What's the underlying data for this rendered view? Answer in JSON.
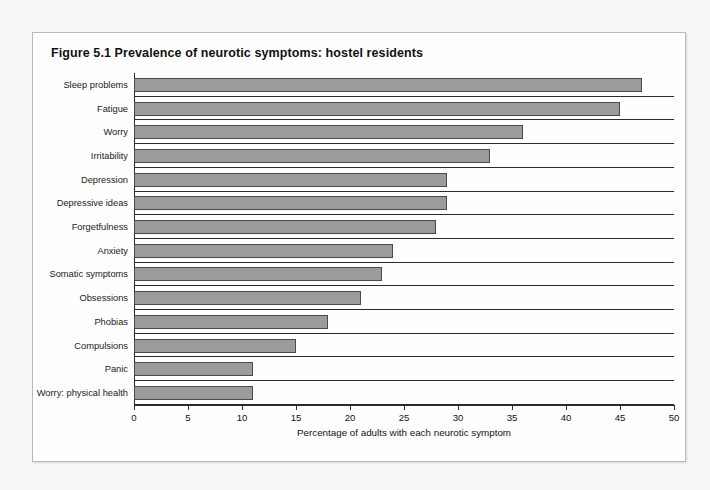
{
  "figure": {
    "title": "Figure 5.1  Prevalence of neurotic symptoms: hostel residents"
  },
  "chart_data": {
    "type": "bar",
    "orientation": "horizontal",
    "title": "Figure 5.1  Prevalence of neurotic symptoms: hostel residents",
    "xlabel": "Percentage of adults with each neurotic symptom",
    "ylabel": "",
    "xlim": [
      0,
      50
    ],
    "xticks": [
      0,
      5,
      10,
      15,
      20,
      25,
      30,
      35,
      40,
      45,
      50
    ],
    "xtick_labels": [
      "0",
      "5",
      "10",
      "15",
      "20",
      "25",
      "30",
      "35",
      "40",
      "45",
      "50"
    ],
    "grid": false,
    "legend": false,
    "bar_color": "#9b9b9b",
    "bar_edge_color": "#4a4a4a",
    "categories": [
      "Sleep problems",
      "Fatigue",
      "Worry",
      "Irritability",
      "Depression",
      "Depressive ideas",
      "Forgetfulness",
      "Anxiety",
      "Somatic symptoms",
      "Obsessions",
      "Phobias",
      "Compulsions",
      "Panic",
      "Worry: physical health"
    ],
    "values": [
      47,
      45,
      36,
      33,
      29,
      29,
      28,
      24,
      23,
      21,
      18,
      15,
      11,
      11
    ]
  }
}
